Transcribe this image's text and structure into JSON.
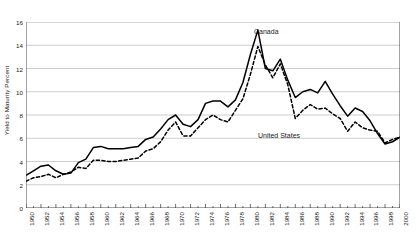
{
  "axis": {
    "ylabel": "Yield to Maturity Percent",
    "yticks": [
      "0",
      "2",
      "4",
      "6",
      "8",
      "10",
      "12",
      "14",
      "16"
    ],
    "xticks": [
      "1950",
      "1952",
      "1954",
      "1956",
      "1958",
      "1960",
      "1962",
      "1964",
      "1966",
      "1968",
      "1970",
      "1972",
      "1974",
      "1976",
      "1978",
      "1980",
      "1982",
      "1984",
      "1986",
      "1988",
      "1990",
      "1992",
      "1994",
      "1996",
      "1998",
      "2000"
    ]
  },
  "annotations": {
    "canada_label": "Canada",
    "united_states_label": "United States"
  },
  "colors": {
    "line": "#000000",
    "grid": "#b8b8b8",
    "axis": "#333333",
    "text": "#1a1a1a",
    "background": "#ffffff"
  },
  "chart_data": {
    "type": "line",
    "title": "",
    "subtitle": "",
    "xlabel": "",
    "ylabel": "Yield to Maturity Percent",
    "xlim": [
      1950,
      2000
    ],
    "ylim": [
      0,
      16
    ],
    "ytick_interval": 2,
    "xtick_interval": 2,
    "grid": "horizontal",
    "legend": "inline-annotations",
    "x": [
      1950,
      1951,
      1952,
      1953,
      1954,
      1955,
      1956,
      1957,
      1958,
      1959,
      1960,
      1961,
      1962,
      1963,
      1964,
      1965,
      1966,
      1967,
      1968,
      1969,
      1970,
      1971,
      1972,
      1973,
      1974,
      1975,
      1976,
      1977,
      1978,
      1979,
      1980,
      1981,
      1982,
      1983,
      1984,
      1985,
      1986,
      1987,
      1988,
      1989,
      1990,
      1991,
      1992,
      1993,
      1994,
      1995,
      1996,
      1997,
      1998,
      1999,
      2000
    ],
    "series": [
      {
        "name": "Canada",
        "style": "solid",
        "values": [
          2.8,
          3.2,
          3.6,
          3.7,
          3.2,
          2.9,
          3.0,
          3.9,
          4.2,
          5.2,
          5.3,
          5.1,
          5.1,
          5.1,
          5.2,
          5.3,
          5.9,
          6.1,
          6.8,
          7.6,
          8.0,
          7.2,
          7.0,
          7.6,
          9.0,
          9.2,
          9.2,
          8.7,
          9.3,
          10.8,
          13.2,
          15.3,
          12.0,
          11.8,
          12.8,
          11.0,
          9.5,
          10.0,
          10.2,
          9.9,
          10.9,
          9.8,
          8.8,
          7.9,
          8.6,
          8.3,
          7.5,
          6.4,
          5.5,
          5.7,
          6.1
        ]
      },
      {
        "name": "United States",
        "style": "dashed",
        "values": [
          2.3,
          2.6,
          2.7,
          2.9,
          2.6,
          2.9,
          3.1,
          3.5,
          3.4,
          4.1,
          4.1,
          4.0,
          4.0,
          4.1,
          4.2,
          4.3,
          4.9,
          5.1,
          5.7,
          6.7,
          7.4,
          6.2,
          6.2,
          6.9,
          7.6,
          8.0,
          7.6,
          7.4,
          8.4,
          9.4,
          11.5,
          13.9,
          12.3,
          11.2,
          12.4,
          10.6,
          7.7,
          8.4,
          8.9,
          8.5,
          8.6,
          8.1,
          7.7,
          6.6,
          7.4,
          6.9,
          6.7,
          6.6,
          5.6,
          5.9,
          6.1
        ]
      }
    ]
  }
}
